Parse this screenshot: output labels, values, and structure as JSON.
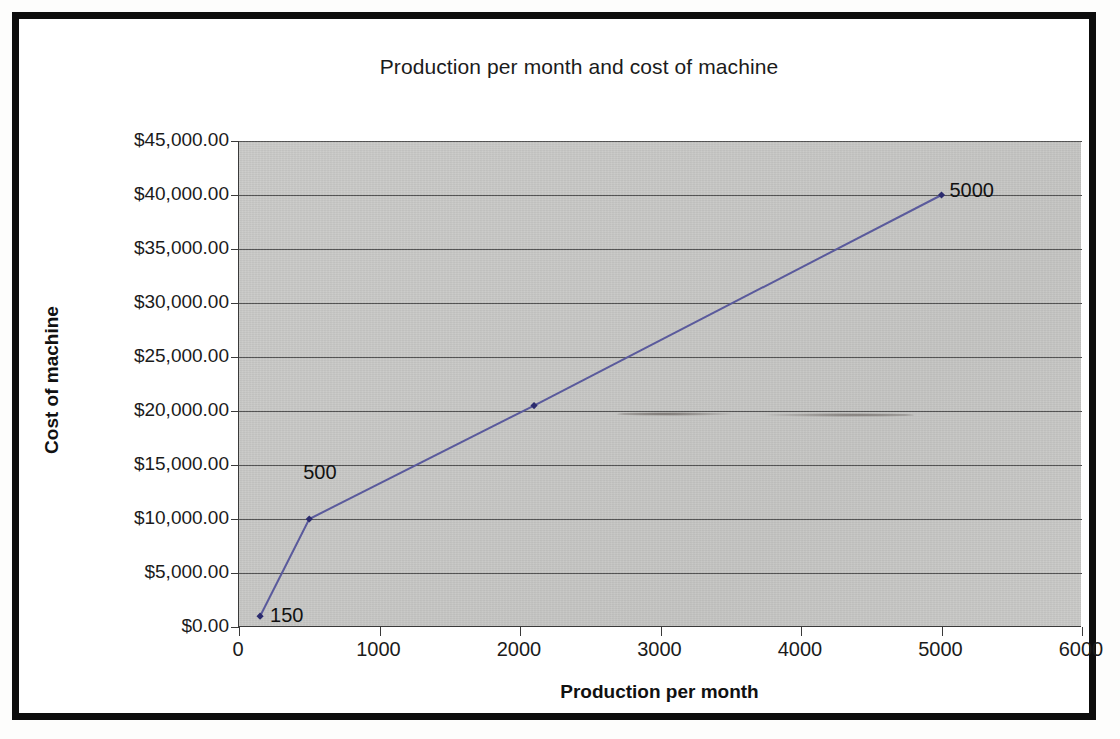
{
  "chart_data": {
    "type": "line",
    "title": "Production per month and cost of machine",
    "xlabel": "Production per month",
    "ylabel": "Cost of machine",
    "x": [
      150,
      500,
      2100,
      5000
    ],
    "values": [
      1000,
      10000,
      20500,
      40000
    ],
    "point_labels": [
      "150",
      "500",
      "",
      "5000"
    ],
    "series": [
      {
        "name": "Cost of machine",
        "x": [
          150,
          500,
          2100,
          5000
        ],
        "values": [
          1000,
          10000,
          20500,
          40000
        ],
        "color": "#5a5a9c"
      }
    ],
    "xlim": [
      0,
      6000
    ],
    "ylim": [
      0,
      45000
    ],
    "xticks": [
      0,
      1000,
      2000,
      3000,
      4000,
      5000,
      6000
    ],
    "xtick_labels": [
      "0",
      "1000",
      "2000",
      "3000",
      "4000",
      "5000",
      "6000"
    ],
    "yticks": [
      0,
      5000,
      10000,
      15000,
      20000,
      25000,
      30000,
      35000,
      40000,
      45000
    ],
    "ytick_labels": [
      "$0.00",
      "$5,000.00",
      "$10,000.00",
      "$15,000.00",
      "$20,000.00",
      "$25,000.00",
      "$30,000.00",
      "$35,000.00",
      "$40,000.00",
      "$45,000.00"
    ],
    "grid": "horizontal",
    "legend": "none",
    "plot_background": "#c6c6c4",
    "marker": "diamond",
    "marker_color": "#2b2b6e"
  }
}
